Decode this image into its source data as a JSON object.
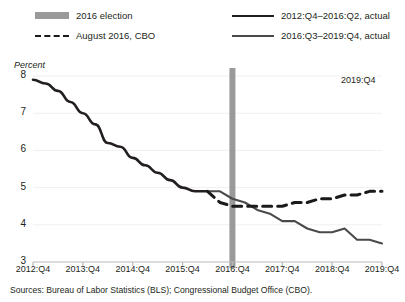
{
  "legend": {
    "items": [
      {
        "key": "election",
        "label": "2016 election",
        "swatch": "block",
        "color": "#9a9a9a"
      },
      {
        "key": "cbo",
        "label": "August 2016, CBO",
        "swatch": "dashed",
        "color": "#1a1a1a"
      },
      {
        "key": "actual1",
        "label": "2012:Q4–2016:Q2, actual",
        "swatch": "solid",
        "color": "#231f20"
      },
      {
        "key": "actual2",
        "label": "2016:Q3–2019:Q4, actual",
        "swatch": "solid",
        "color": "#4a4a4a"
      }
    ]
  },
  "annotations": {
    "y_axis_title": "Percent",
    "end_point_label": "2019:Q4"
  },
  "source_note": "Sources: Bureau of Labor Statistics (BLS); Congressional Budget Office (CBO).",
  "chart_data": {
    "type": "line",
    "title": "",
    "xlabel": "",
    "ylabel": "Percent",
    "ylim": [
      3,
      8
    ],
    "yticks": [
      3,
      4,
      5,
      6,
      7,
      8
    ],
    "xlim": [
      "2012:Q4",
      "2019:Q4"
    ],
    "xticks": [
      "2012:Q4",
      "2013:Q4",
      "2014:Q4",
      "2015:Q4",
      "2016:Q4",
      "2017:Q4",
      "2018:Q4",
      "2019:Q4"
    ],
    "grid": false,
    "legend_position": "top",
    "x": [
      "2012:Q4",
      "2013:Q1",
      "2013:Q2",
      "2013:Q3",
      "2013:Q4",
      "2014:Q1",
      "2014:Q2",
      "2014:Q3",
      "2014:Q4",
      "2015:Q1",
      "2015:Q2",
      "2015:Q3",
      "2015:Q4",
      "2016:Q1",
      "2016:Q2",
      "2016:Q3",
      "2016:Q4",
      "2017:Q1",
      "2017:Q2",
      "2017:Q3",
      "2017:Q4",
      "2018:Q1",
      "2018:Q2",
      "2018:Q3",
      "2018:Q4",
      "2019:Q1",
      "2019:Q2",
      "2019:Q3",
      "2019:Q4"
    ],
    "series": [
      {
        "name": "2012:Q4–2016:Q2, actual",
        "color": "#231f20",
        "style": "solid",
        "x": [
          "2012:Q4",
          "2013:Q1",
          "2013:Q2",
          "2013:Q3",
          "2013:Q4",
          "2014:Q1",
          "2014:Q2",
          "2014:Q3",
          "2014:Q4",
          "2015:Q1",
          "2015:Q2",
          "2015:Q3",
          "2015:Q4",
          "2016:Q1",
          "2016:Q2"
        ],
        "values": [
          7.9,
          7.8,
          7.6,
          7.3,
          7.0,
          6.7,
          6.2,
          6.1,
          5.8,
          5.6,
          5.4,
          5.2,
          5.0,
          4.9,
          4.9
        ]
      },
      {
        "name": "2016:Q3–2019:Q4, actual",
        "color": "#4a4a4a",
        "style": "solid",
        "x": [
          "2016:Q2",
          "2016:Q3",
          "2016:Q4",
          "2017:Q1",
          "2017:Q2",
          "2017:Q3",
          "2017:Q4",
          "2018:Q1",
          "2018:Q2",
          "2018:Q3",
          "2018:Q4",
          "2019:Q1",
          "2019:Q2",
          "2019:Q3",
          "2019:Q4"
        ],
        "values": [
          4.9,
          4.9,
          4.7,
          4.6,
          4.4,
          4.3,
          4.1,
          4.1,
          3.9,
          3.8,
          3.8,
          3.9,
          3.6,
          3.6,
          3.5
        ]
      },
      {
        "name": "August 2016, CBO",
        "color": "#1a1a1a",
        "style": "dashed",
        "x": [
          "2016:Q2",
          "2016:Q3",
          "2016:Q4",
          "2017:Q1",
          "2017:Q2",
          "2017:Q3",
          "2017:Q4",
          "2018:Q1",
          "2018:Q2",
          "2018:Q3",
          "2018:Q4",
          "2019:Q1",
          "2019:Q2",
          "2019:Q3",
          "2019:Q4"
        ],
        "values": [
          4.9,
          4.6,
          4.5,
          4.5,
          4.5,
          4.5,
          4.5,
          4.6,
          4.6,
          4.7,
          4.7,
          4.8,
          4.8,
          4.9,
          4.9
        ]
      }
    ],
    "vline": {
      "at": "2016:Q4",
      "label": "2016 election",
      "color": "#9a9a9a",
      "width_px": 6
    }
  }
}
